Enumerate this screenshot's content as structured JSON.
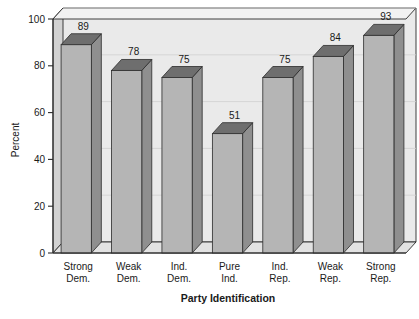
{
  "chart_data": {
    "type": "bar",
    "title": "",
    "xlabel": "Party Identification",
    "ylabel": "Percent",
    "categories": [
      "Strong Dem.",
      "Weak Dem.",
      "Ind. Dem.",
      "Pure Ind.",
      "Ind. Rep.",
      "Weak Rep.",
      "Strong Rep."
    ],
    "category_lines": [
      [
        "Strong",
        "Dem."
      ],
      [
        "Weak",
        "Dem."
      ],
      [
        "Ind.",
        "Dem."
      ],
      [
        "Pure",
        "Ind."
      ],
      [
        "Ind.",
        "Rep."
      ],
      [
        "Weak",
        "Rep."
      ],
      [
        "Strong",
        "Rep."
      ]
    ],
    "values": [
      89,
      78,
      75,
      51,
      75,
      84,
      93
    ],
    "value_labels": [
      "89",
      "78",
      "75",
      "51",
      "75",
      "84",
      "93"
    ],
    "ylim": [
      0,
      100
    ],
    "yticks": [
      0,
      20,
      40,
      60,
      80,
      100
    ],
    "ytick_labels": [
      "0",
      "20",
      "40",
      "60",
      "80",
      "100"
    ],
    "grid": true,
    "legend": "none",
    "style": "3d-column"
  },
  "colors": {
    "plot_background": "#eaeaea",
    "page_background": "#ffffff",
    "bar_front": "#b5b5b5",
    "bar_top": "#6e6e6e",
    "bar_side": "#8f8f8f",
    "bar_outline": "#2b2b2b",
    "wall_side": "#d2d2d2",
    "floor": "#e2e2e2",
    "gridline": "#cfcfcf",
    "axis": "#2b2b2b",
    "text": "#1a1a1a"
  }
}
